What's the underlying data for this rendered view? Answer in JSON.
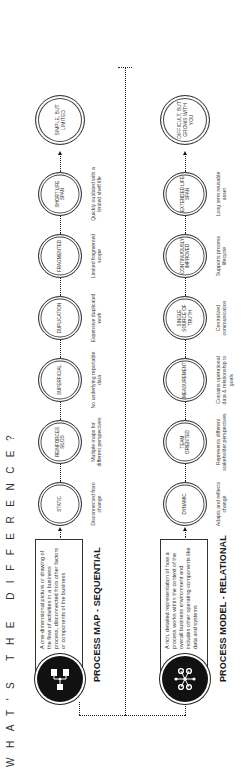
{
  "title": "WHAT'S THE DIFFERENCE?",
  "lanes": [
    {
      "title": "PROCESS MAP - SEQUENTIAL",
      "icon": "flowchart-icon",
      "intro": "A one-dimensional picture or drawing of the flow of activities in a business process, disconnected from other factors or components of the business",
      "nodes": [
        {
          "label": "STATIC",
          "desc": "Disconnected from change"
        },
        {
          "label": "REINFORCES SILOS",
          "desc": "Multiple maps for different perspectives"
        },
        {
          "label": "SUPERFICIAL",
          "desc": "No underlying reportable data"
        },
        {
          "label": "DUPLICATION",
          "desc": "Expensive duplicated work"
        },
        {
          "label": "FRAGMENTED",
          "desc": "Limited fragmented scope"
        },
        {
          "label": "SHORT LIFE SPAN",
          "desc": "Quickly outdated with a limited shelf life"
        }
      ],
      "final": "SIMPLE, BUT LIMITED"
    },
    {
      "title": "PROCESS MODEL - RELATIONAL",
      "icon": "network-icon",
      "intro": "A rich, detailed representation of how a process works within the context of the overall business environment and includes other operating components like data and systems",
      "nodes": [
        {
          "label": "DYNAMIC",
          "desc": "Adapts and reflects change"
        },
        {
          "label": "TEAM ORIENTED",
          "desc": "Represents different stakeholder perspectives"
        },
        {
          "label": "MEASUREMENT",
          "desc": "Contains operational data & relationship to goals"
        },
        {
          "label": "SINGLE SOURCE OF TRUTH",
          "desc": "Centralized communication"
        },
        {
          "label": "CONTINUOUSLY IMPROVED",
          "desc": "Supports process lifecycle"
        },
        {
          "label": "EXTENDED LIFE SPAN",
          "desc": "Long term reusable asset"
        }
      ],
      "final": "DIFFICULT, BUT GROWS WITH YOU"
    }
  ]
}
